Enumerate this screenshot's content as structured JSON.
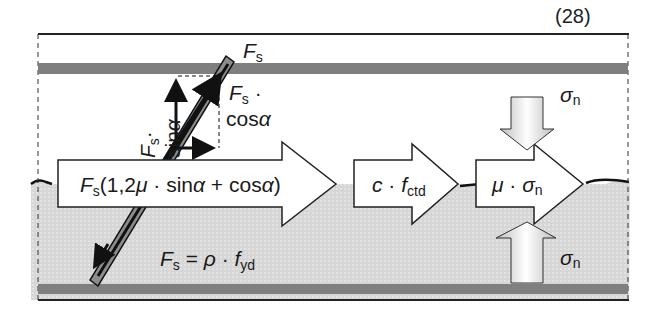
{
  "equation_number": "(28)",
  "colors": {
    "concrete_top": "#ffffff",
    "concrete_bottom": "#d9d9d9",
    "rebar_band": "#7a7a7a",
    "stroke": "#111111",
    "arrow_fill": "#ffffff",
    "bar_fill": "#8c8c8c"
  },
  "labels": {
    "fs_top": {
      "main": "F",
      "sub": "s"
    },
    "fs_sin": {
      "main": "F",
      "sub": "s",
      "dot": "·",
      "func": "sin",
      "angle": "α"
    },
    "fs_cos": {
      "main": "F",
      "sub": "s",
      "dot": " ·",
      "func": "cos",
      "angle": "α"
    },
    "sigma_top": {
      "main": "σ",
      "sub": "n"
    },
    "sigma_bottom": {
      "main": "σ",
      "sub": "n"
    },
    "fs_rho": {
      "main": "F",
      "sub": "s",
      "eq": " = ",
      "rho": "ρ",
      "dot": " · ",
      "f": "f",
      "fsub": "yd"
    }
  },
  "arrows": [
    {
      "id": "dowel",
      "parts": {
        "F": "F",
        "s": "s",
        "body": "(1,2",
        "mu": "μ",
        "mid": " · sin",
        "a1": "α",
        "plus": " + cos",
        "a2": "α",
        "close": ")"
      }
    },
    {
      "id": "cohesion",
      "parts": {
        "c": "c",
        "dot": " · ",
        "f": "f",
        "sub": "ctd"
      }
    },
    {
      "id": "friction",
      "parts": {
        "mu": "μ",
        "dot": " · ",
        "sigma": "σ",
        "sub": "n"
      }
    }
  ]
}
